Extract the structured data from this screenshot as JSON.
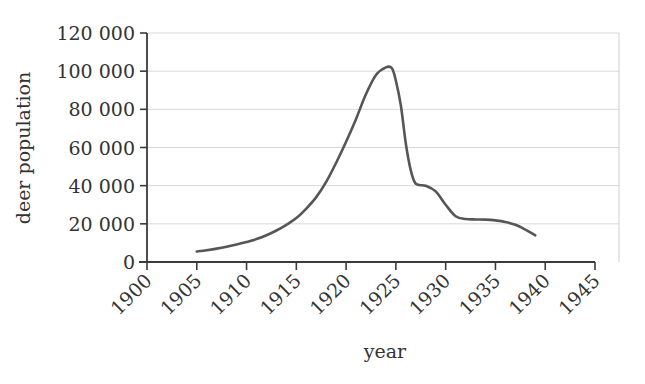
{
  "chart_data": {
    "type": "line",
    "title": "",
    "xlabel": "year",
    "ylabel": "deer population",
    "xlim": [
      1900,
      1945
    ],
    "ylim": [
      0,
      120000
    ],
    "grid": true,
    "legend": false,
    "legend_position": "none",
    "line_color": "#565656",
    "grid_color": "#d8d8d8",
    "axis_color": "#3a3a3a",
    "background": "#ffffff",
    "xticks": [
      1900,
      1905,
      1910,
      1915,
      1920,
      1925,
      1930,
      1935,
      1940,
      1945
    ],
    "xtick_labels": [
      "1900",
      "1905",
      "1910",
      "1915",
      "1920",
      "1925",
      "1930",
      "1935",
      "1940",
      "1945"
    ],
    "xtick_rotation": 45,
    "yticks": [
      0,
      20000,
      40000,
      60000,
      80000,
      100000,
      120000
    ],
    "ytick_labels": [
      "0",
      "20 000",
      "40 000",
      "60 000",
      "80 000",
      "100 000",
      "120 000"
    ],
    "series": [
      {
        "name": "deer population",
        "x": [
          1905,
          1906,
          1907,
          1908,
          1909,
          1910,
          1911,
          1912,
          1913,
          1914,
          1915,
          1916,
          1917,
          1918,
          1919,
          1920,
          1921,
          1922,
          1923,
          1924,
          1924.6,
          1925,
          1925.5,
          1926,
          1926.5,
          1927,
          1928,
          1929,
          1930,
          1931,
          1932,
          1933,
          1934,
          1935,
          1936,
          1937,
          1938,
          1939
        ],
        "y": [
          5500,
          6200,
          7000,
          8000,
          9200,
          10500,
          12000,
          14000,
          16500,
          19500,
          23000,
          28000,
          34000,
          42000,
          52000,
          63000,
          75000,
          88000,
          98000,
          102000,
          101500,
          95000,
          82000,
          62000,
          48000,
          41000,
          40000,
          37000,
          30000,
          24000,
          22500,
          22300,
          22200,
          21800,
          21000,
          19500,
          17000,
          14000
        ]
      }
    ]
  },
  "axis_labels": {
    "x_title": "year",
    "y_title": "deer population"
  }
}
